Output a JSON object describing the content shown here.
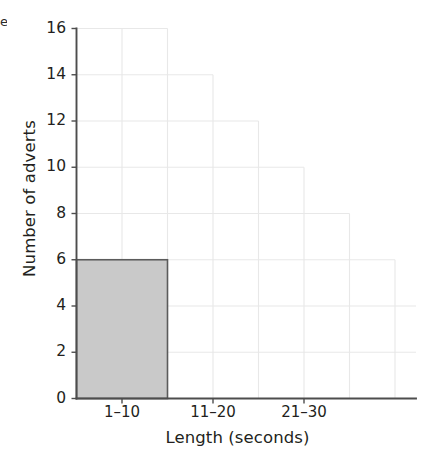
{
  "figure": {
    "corner_mark": "e",
    "axes": {
      "y_title": "Number of adverts",
      "x_title": "Length (seconds)",
      "y_ticks": [
        0,
        2,
        4,
        6,
        8,
        10,
        12,
        14,
        16
      ],
      "x_tick_labels": [
        "1–10",
        "11–20",
        "21–30"
      ]
    },
    "colors": {
      "bar_fill": "#c9c9c9",
      "bar_stroke": "#5b5b5b",
      "axis": "#4d4d4d",
      "grid": "#e8e8e8",
      "text": "#231f20"
    }
  },
  "chart_data": {
    "type": "bar",
    "title": "",
    "xlabel": "Length (seconds)",
    "ylabel": "Number of adverts",
    "categories": [
      "1–10",
      "11–20",
      "21–30"
    ],
    "values": [
      6,
      null,
      null
    ],
    "ylim": [
      0,
      16
    ],
    "ytick_step": 2,
    "grid": true,
    "legend": "none"
  }
}
